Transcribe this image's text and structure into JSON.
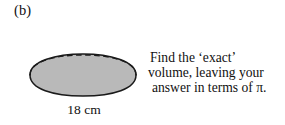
{
  "figure": {
    "part_label": "(b)",
    "shape_name": "hemisphere",
    "fill_color": "#b9b9b9",
    "outline_color": "#1a1a1a",
    "background_color": "#ffffff",
    "hidden_edge_style": "dashed"
  },
  "dimension": {
    "label": "18 cm",
    "value": 18,
    "unit": "cm",
    "measures": "diameter",
    "arrow_style": "double-headed"
  },
  "instruction": {
    "line_1": "Find the ‘exact’",
    "line_2": "volume, leaving your",
    "line_3": "answer in terms of π.",
    "full_text": "Find the ‘exact’ volume, leaving your answer in terms of π."
  }
}
